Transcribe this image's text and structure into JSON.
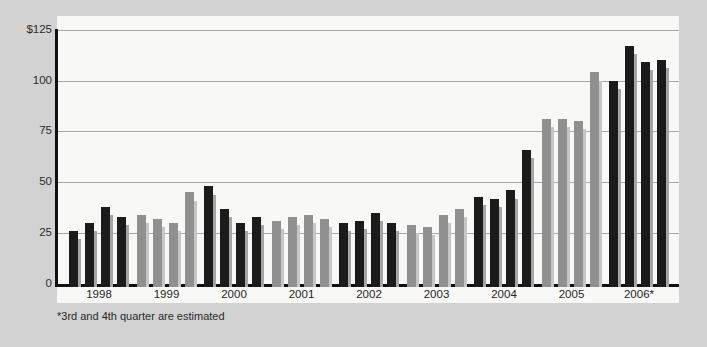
{
  "page": {
    "background_color": "#d2d2d2",
    "plot_background_color": "#f8f8f6"
  },
  "chart_data": {
    "type": "bar",
    "title": "",
    "currency_prefix": "$",
    "ylim": [
      0,
      125
    ],
    "yticks": [
      0,
      25,
      50,
      75,
      100,
      125
    ],
    "ytick_display_top_to_bottom": [
      "$125",
      "100",
      "75",
      "50",
      "25",
      "0"
    ],
    "grid": "horizontal",
    "legend": "none",
    "categories": [
      "1998",
      "1999",
      "2000",
      "2001",
      "2002",
      "2003",
      "2004",
      "2005",
      "2006*"
    ],
    "bars_per_year": 4,
    "groups": [
      {
        "year": "1998",
        "bar_color": "black",
        "values": [
          26,
          30,
          38,
          33
        ]
      },
      {
        "year": "1999",
        "bar_color": "gray",
        "values": [
          34,
          32,
          30,
          45
        ]
      },
      {
        "year": "2000",
        "bar_color": "black",
        "values": [
          48,
          37,
          30,
          33
        ]
      },
      {
        "year": "2001",
        "bar_color": "gray",
        "values": [
          31,
          33,
          34,
          32
        ]
      },
      {
        "year": "2002",
        "bar_color": "black",
        "values": [
          30,
          31,
          35,
          30
        ]
      },
      {
        "year": "2003",
        "bar_color": "gray",
        "values": [
          29,
          28,
          34,
          37
        ]
      },
      {
        "year": "2004",
        "bar_color": "black",
        "values": [
          43,
          42,
          46,
          66
        ]
      },
      {
        "year": "2005",
        "bar_color": "gray",
        "values": [
          81,
          81,
          80,
          104
        ]
      },
      {
        "year": "2006*",
        "bar_color": "black",
        "values": [
          100,
          117,
          109,
          110
        ]
      }
    ],
    "footnote": "*3rd and 4th quarter are estimated"
  },
  "colors": {
    "bar_black": "#1b1b1b",
    "bar_black_shadow": "#a5a5a5",
    "bar_gray": "#909090",
    "bar_gray_shadow": "#c6c6c6",
    "gridline": "#a8a8a8",
    "axis": "#101010",
    "text": "#2a2a2a"
  }
}
